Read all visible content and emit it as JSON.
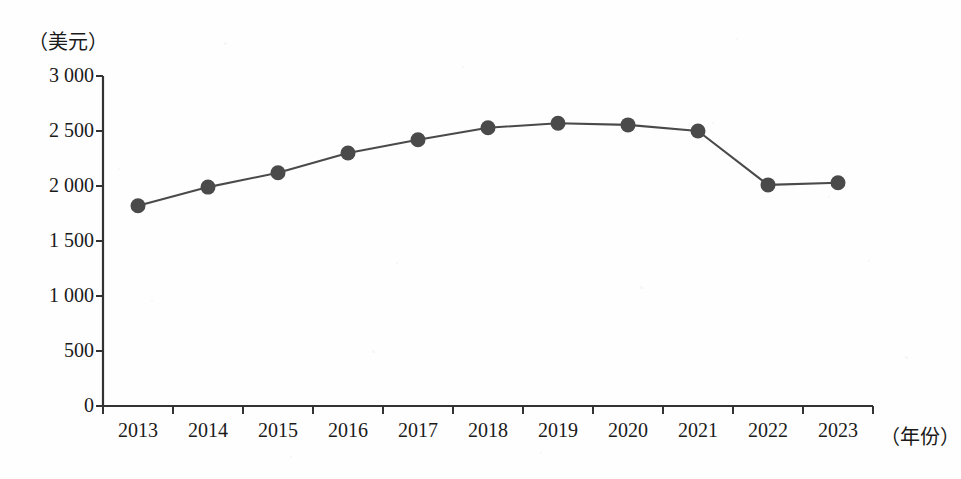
{
  "chart_data": {
    "type": "line",
    "title": "",
    "subtitle": "",
    "xlabel": "（年份）",
    "ylabel": "（美元）",
    "categories": [
      "2013",
      "2014",
      "2015",
      "2016",
      "2017",
      "2018",
      "2019",
      "2020",
      "2021",
      "2022",
      "2023"
    ],
    "values": [
      1820,
      1990,
      2120,
      2300,
      2420,
      2530,
      2570,
      2555,
      2500,
      2010,
      2030
    ],
    "series": [
      {
        "name": "",
        "values": [
          1820,
          1990,
          2120,
          2300,
          2420,
          2530,
          2570,
          2555,
          2500,
          2010,
          2030
        ]
      }
    ],
    "ylim": [
      0,
      3000
    ],
    "ytick_values": [
      0,
      500,
      1000,
      1500,
      2000,
      2500,
      3000
    ],
    "ytick_labels": [
      "0",
      "500",
      "1 000",
      "1 500",
      "2 000",
      "2 500",
      "3 000"
    ],
    "grid": false,
    "legend": "none",
    "marker": "filled-circle",
    "line_color": "#4a4a4a",
    "marker_color": "#4a4a4a",
    "axis_color": "#333333",
    "background_color": "#ffffff"
  },
  "axes": {
    "y_unit_label": "（美元）",
    "x_unit_label": "（年份）"
  }
}
